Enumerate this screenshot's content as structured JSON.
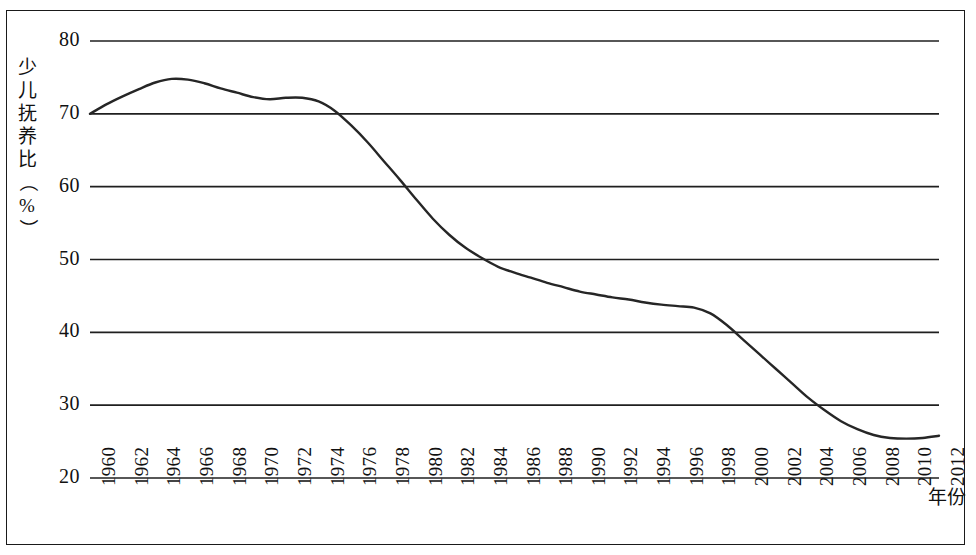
{
  "chart_data": {
    "type": "line",
    "title": "",
    "xlabel": "年份",
    "ylabel": "少儿抚养比（%）",
    "ylabel_chars": [
      "少",
      "儿",
      "抚",
      "养",
      "比",
      "（",
      "%",
      "）"
    ],
    "ylim": [
      20,
      80
    ],
    "ytick_step": 10,
    "yticks": [
      "20",
      "30",
      "40",
      "50",
      "60",
      "70",
      "80"
    ],
    "xlim": [
      1960,
      2012
    ],
    "xtick_step": 2,
    "xticks": [
      "1960",
      "1962",
      "1964",
      "1966",
      "1968",
      "1970",
      "1972",
      "1974",
      "1976",
      "1978",
      "1980",
      "1982",
      "1984",
      "1986",
      "1988",
      "1990",
      "1992",
      "1994",
      "1996",
      "1998",
      "2000",
      "2002",
      "2004",
      "2006",
      "2008",
      "2010",
      "2012"
    ],
    "grid": "horizontal",
    "legend": "none",
    "line_color": "#262626",
    "series": [
      {
        "name": "少儿抚养比",
        "x": [
          1960,
          1961,
          1962,
          1963,
          1964,
          1965,
          1966,
          1967,
          1968,
          1969,
          1970,
          1971,
          1972,
          1973,
          1974,
          1975,
          1976,
          1977,
          1978,
          1979,
          1980,
          1981,
          1982,
          1983,
          1984,
          1985,
          1986,
          1987,
          1988,
          1989,
          1990,
          1991,
          1992,
          1993,
          1994,
          1995,
          1996,
          1997,
          1998,
          1999,
          2000,
          2001,
          2002,
          2003,
          2004,
          2005,
          2006,
          2007,
          2008,
          2009,
          2010,
          2011,
          2012
        ],
        "values": [
          70.0,
          71.3,
          72.4,
          73.4,
          74.3,
          74.8,
          74.7,
          74.2,
          73.5,
          72.9,
          72.3,
          72.0,
          72.2,
          72.2,
          71.7,
          70.4,
          68.4,
          66.1,
          63.5,
          60.9,
          58.2,
          55.6,
          53.4,
          51.6,
          50.2,
          49.0,
          48.2,
          47.5,
          46.8,
          46.2,
          45.6,
          45.2,
          44.8,
          44.5,
          44.1,
          43.8,
          43.6,
          43.4,
          42.6,
          41.0,
          39.0,
          37.0,
          35.0,
          33.0,
          31.0,
          29.3,
          27.8,
          26.7,
          25.9,
          25.5,
          25.4,
          25.5,
          25.8
        ]
      }
    ]
  }
}
